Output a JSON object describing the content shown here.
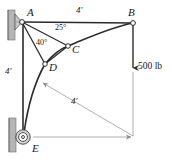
{
  "figure": {
    "type": "engineering-statics-diagram",
    "colors": {
      "line": "#1a1a1a",
      "dimension_line": "#8d8d8d",
      "wall_fill": "#b5b5b5",
      "wall_edge": "#6e6e6e",
      "node_fill": "#ffffff",
      "background": "#ffffff"
    }
  },
  "points": {
    "A": {
      "label": "A",
      "x": 22,
      "y": 22
    },
    "B": {
      "label": "B",
      "x": 133,
      "y": 23
    },
    "C": {
      "label": "C",
      "x": 68,
      "y": 46
    },
    "D": {
      "label": "D",
      "x": 45,
      "y": 64
    },
    "E": {
      "label": "E",
      "x": 23,
      "y": 137
    }
  },
  "angles": [
    {
      "name": "angle-A-to-C",
      "value": "25",
      "unit": "degrees",
      "label": "25°",
      "at": "A",
      "x": 55,
      "y": 28
    },
    {
      "name": "angle-A-to-D",
      "value": "40",
      "unit": "degrees",
      "label": "40°",
      "at": "A",
      "x": 38,
      "y": 42
    }
  ],
  "dimensions": [
    {
      "name": "span-A-to-B",
      "label": "4'",
      "orientation": "horizontal",
      "x": 78,
      "y": 8
    },
    {
      "name": "height-A-to-E",
      "label": "4'",
      "orientation": "vertical",
      "x": 6,
      "y": 70
    },
    {
      "name": "diagonal-radius",
      "label": "4'",
      "orientation": "diagonal",
      "x": 72,
      "y": 100
    }
  ],
  "loads": [
    {
      "name": "load-at-B",
      "label": "500 lb",
      "magnitude": "500",
      "unit": "lb",
      "direction": "down",
      "x": 138,
      "y": 63
    }
  ],
  "supports": [
    {
      "name": "pin-support-A",
      "kind": "pin",
      "x": 22,
      "y": 22
    },
    {
      "name": "pulley-support-E",
      "kind": "pulley",
      "x": 23,
      "y": 137
    }
  ],
  "members": [
    {
      "name": "cable-A-B",
      "from": "A",
      "to": "B",
      "kind": "straight"
    },
    {
      "name": "strut-A-C",
      "from": "A",
      "to": "C",
      "kind": "straight"
    },
    {
      "name": "strut-A-D",
      "from": "A",
      "to": "D",
      "kind": "straight"
    },
    {
      "name": "cable-A-E",
      "from": "A",
      "to": "E",
      "kind": "straight"
    },
    {
      "name": "cable-E-D-C-B",
      "from": "E",
      "to": "B",
      "kind": "curved",
      "passes": [
        "D",
        "C"
      ]
    },
    {
      "name": "load-line-B",
      "from": "B",
      "to": "load",
      "kind": "straight"
    }
  ]
}
